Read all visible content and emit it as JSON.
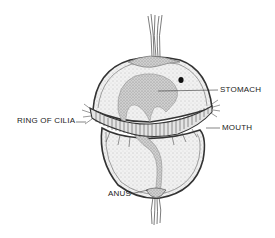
{
  "diagram": {
    "labels": {
      "stomach": "STOMACH",
      "mouth": "MOUTH",
      "ring_of_cilia": "RING OF CILIA",
      "anus": "ANUS"
    },
    "colors": {
      "outline": "#333333",
      "body_fill": "#ececec",
      "stomach_fill": "#c4c4c4",
      "background": "#ffffff"
    }
  }
}
